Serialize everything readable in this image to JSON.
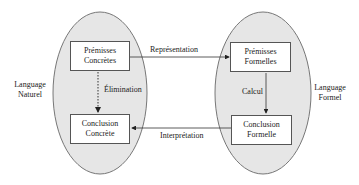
{
  "diagram": {
    "left_region": {
      "label_line1": "Language",
      "label_line2": "Naturel"
    },
    "right_region": {
      "label_line1": "Language",
      "label_line2": "Formel"
    },
    "boxes": {
      "premises_concrete": {
        "line1": "Prémisses",
        "line2": "Concrètes"
      },
      "conclusion_concrete": {
        "line1": "Conclusion",
        "line2": "Concrète"
      },
      "premises_formal": {
        "line1": "Prémisses",
        "line2": "Formelles"
      },
      "conclusion_formal": {
        "line1": "Conclusion",
        "line2": "Formelle"
      }
    },
    "edges": {
      "representation": "Représentation",
      "elimination": "Élimination",
      "calcul": "Calcul",
      "interpretation": "Interprétation"
    },
    "colors": {
      "ellipse_fill": "#e6e6e6",
      "stroke": "#555555"
    }
  }
}
